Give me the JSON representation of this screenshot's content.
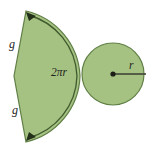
{
  "figure": {
    "background_color": "#ffffff",
    "fill_color": "#a6c283",
    "outline_color": "#5f7f45",
    "label_color": "#23251c"
  },
  "sector": {
    "name": "lateral-surface-sector",
    "slant_label_top": "g",
    "slant_label_bottom": "g",
    "arc_label": "2πr",
    "apex": {
      "x": 14,
      "y": 76
    },
    "top_vertex": {
      "x": 26,
      "y": 11
    },
    "bottom_vertex": {
      "x": 26,
      "y": 142
    },
    "arc_extreme": {
      "x": 80,
      "y": 76
    }
  },
  "circle": {
    "name": "base-circle",
    "radius_label": "r",
    "center": {
      "x": 113,
      "y": 74
    },
    "radius_px": 31
  },
  "labels": {
    "g_top": {
      "text": "g",
      "x": 10,
      "y": 45
    },
    "g_bottom": {
      "text": "g",
      "x": 13,
      "y": 110
    },
    "arc": {
      "text": "2πr",
      "x": 52,
      "y": 72
    },
    "radius": {
      "text": "r",
      "x": 130,
      "y": 66
    }
  }
}
